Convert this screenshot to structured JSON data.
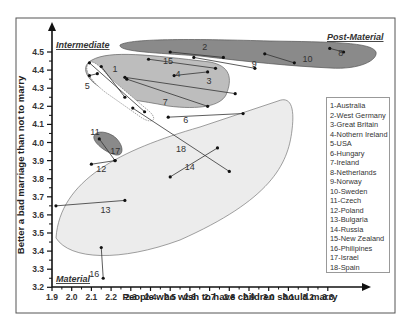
{
  "chart_data": {
    "type": "scatter",
    "title": "",
    "xlabel": "People who wish to have children should marry",
    "ylabel": "Better a bad marriage than not to marry",
    "xlim": [
      1.9,
      3.3
    ],
    "ylim": [
      3.2,
      4.5
    ],
    "x_ticks": [
      "1.9",
      "2.0",
      "2.1",
      "2.2",
      "2.3",
      "2.4",
      "2.5",
      "2.6",
      "2.7",
      "2.8",
      "2.9",
      "3.0",
      "3.1",
      "3.2",
      "3.3"
    ],
    "y_ticks": [
      "4.5",
      "4.4",
      "4.3",
      "4.2",
      "4.1",
      "4.0",
      "3.9",
      "3.8",
      "3.7",
      "3.6",
      "3.5",
      "3.4",
      "3.3",
      "3.2"
    ],
    "grid": false,
    "legend_position": "right",
    "regions": [
      {
        "name": "Intermediate",
        "color": "#bdbdbd"
      },
      {
        "name": "Post-Material",
        "color": "#8a8a8a"
      },
      {
        "name": "Material",
        "color": "#ececec"
      }
    ],
    "series": [
      {
        "id": 1,
        "name": "Australia",
        "start": [
          2.15,
          4.42
        ],
        "end": [
          2.27,
          4.25
        ]
      },
      {
        "id": 2,
        "name": "West Germany",
        "start": [
          2.5,
          4.5
        ],
        "end": [
          2.77,
          4.47
        ]
      },
      {
        "id": 3,
        "name": "Great Britain",
        "start": [
          2.52,
          4.37
        ],
        "end": [
          2.69,
          4.39
        ]
      },
      {
        "id": 4,
        "name": "Nothern Ireland",
        "start": [
          2.27,
          4.36
        ],
        "end": [
          2.83,
          4.27
        ]
      },
      {
        "id": 5,
        "name": "USA",
        "start": [
          2.09,
          4.37
        ],
        "end": [
          2.13,
          4.38
        ]
      },
      {
        "id": 6,
        "name": "Hungary",
        "start": [
          2.49,
          4.14
        ],
        "end": [
          2.87,
          4.16
        ]
      },
      {
        "id": 7,
        "name": "Ireland",
        "start": [
          2.28,
          4.35
        ],
        "end": [
          2.69,
          4.2
        ]
      },
      {
        "id": 8,
        "name": "Netherlands",
        "start": [
          3.31,
          4.52
        ],
        "end": [
          3.38,
          4.5
        ]
      },
      {
        "id": 9,
        "name": "Norway",
        "start": [
          2.62,
          4.47
        ],
        "end": [
          2.93,
          4.41
        ]
      },
      {
        "id": 10,
        "name": "Sweden",
        "start": [
          2.98,
          4.49
        ],
        "end": [
          3.13,
          4.44
        ]
      },
      {
        "id": 11,
        "name": "Czech",
        "start": [
          2.09,
          4.44
        ],
        "end": [
          2.37,
          4.17
        ]
      },
      {
        "id": 12,
        "name": "Poland",
        "start": [
          2.1,
          3.88
        ],
        "end": [
          2.22,
          3.9
        ]
      },
      {
        "id": 13,
        "name": "Bulgaria",
        "start": [
          1.92,
          3.65
        ],
        "end": [
          2.27,
          3.68
        ]
      },
      {
        "id": 14,
        "name": "Russia",
        "start": [
          2.5,
          3.81
        ],
        "end": [
          2.74,
          3.97
        ]
      },
      {
        "id": 15,
        "name": "New Zealand",
        "start": [
          2.39,
          4.46
        ],
        "end": [
          2.73,
          4.41
        ]
      },
      {
        "id": 16,
        "name": "Philipines",
        "start": [
          2.15,
          3.42
        ],
        "end": [
          2.16,
          3.25
        ]
      },
      {
        "id": 17,
        "name": "Israel",
        "start": [
          2.14,
          4.02
        ],
        "end": [
          2.22,
          3.9
        ]
      },
      {
        "id": 18,
        "name": "Spain",
        "start": [
          2.31,
          4.19
        ],
        "end": [
          2.8,
          3.84
        ]
      }
    ]
  },
  "labels": {
    "intermediate": "Intermediate",
    "post_material": "Post-Material",
    "material": "Material",
    "xlabel": "People who wish to have children should marry",
    "ylabel": "Better a bad marriage than not to marry"
  },
  "legend": [
    "1-Australia",
    "2-West Germany",
    "3-Great Britain",
    "4-Nothern Ireland",
    "5-USA",
    "6-Hungary",
    "7-Ireland",
    "8-Netherlands",
    "9-Norway",
    "10-Sweden",
    "11-Czech",
    "12-Poland",
    "13-Bulgaria",
    "14-Russia",
    "15-New Zealand",
    "16-Philipines",
    "17-Israel",
    "18-Spain"
  ],
  "point_labels": [
    "1",
    "2",
    "3",
    "4",
    "5",
    "6",
    "7",
    "8",
    "9",
    "10",
    "11",
    "12",
    "13",
    "14",
    "15",
    "16",
    "17",
    "18"
  ]
}
